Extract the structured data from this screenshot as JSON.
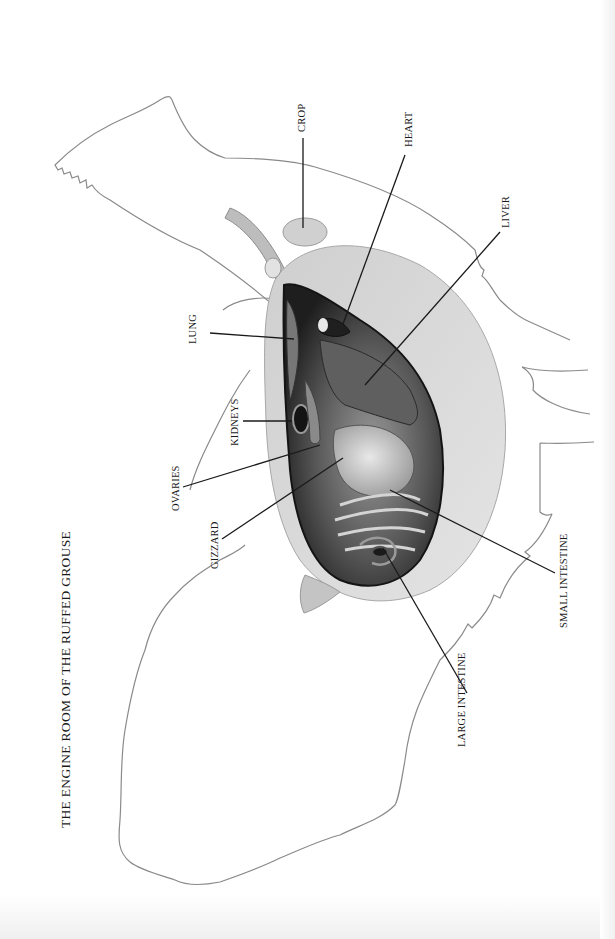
{
  "title": "THE ENGINE ROOM OF THE RUFFED GROUSE",
  "labels": {
    "crop": "CROP",
    "heart": "HEART",
    "liver": "LIVER",
    "lung": "LUNG",
    "kidneys": "KIDNEYS",
    "ovaries": "OVARIES",
    "gizzard": "GIZZARD",
    "small_intestine": "SMALL INTESTINE",
    "large_intestine": "LARGE INTESTINE"
  },
  "colors": {
    "outline": "#8a8a8a",
    "leader_line": "#1a1a1a",
    "cavity_dark": "#2b2b2b",
    "organ_mid": "#6e6e6e",
    "organ_light": "#c9c9c9",
    "body_wall": "#d8d8d8"
  }
}
